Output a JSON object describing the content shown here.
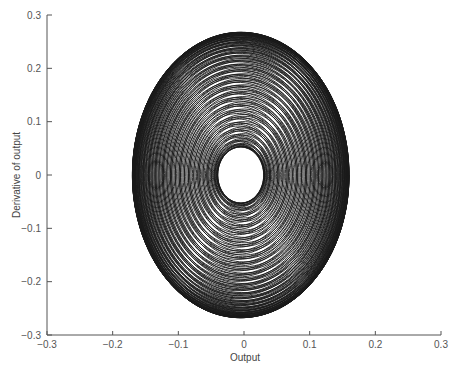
{
  "chart_data": {
    "type": "line",
    "title": "",
    "xlabel": "Output",
    "ylabel": "Derivative of output",
    "xlim": [
      -0.3,
      0.3
    ],
    "ylim": [
      -0.3,
      0.3
    ],
    "xticks": [
      -0.3,
      -0.2,
      -0.1,
      0,
      0.1,
      0.2,
      0.3
    ],
    "yticks": [
      -0.3,
      -0.2,
      -0.1,
      0,
      0.1,
      0.2,
      0.3
    ],
    "xtick_labels": [
      "−0.3",
      "−0.2",
      "−0.1",
      "0",
      "0.1",
      "0.2",
      "0.3"
    ],
    "ytick_labels": [
      "−0.3",
      "−0.2",
      "−0.1",
      "0",
      "0.1",
      "0.2",
      "0.3"
    ],
    "grid": false,
    "legend": null,
    "extent": {
      "x_min": -0.17,
      "x_max": 0.16,
      "y_min": -0.26,
      "y_max": 0.255
    },
    "model": {
      "amp1": 0.1,
      "amp2": 0.065,
      "omega": 1.6,
      "ratio": 1.035,
      "t_end": 560,
      "steps": 14000
    },
    "line_color": "#1a1a1a"
  }
}
